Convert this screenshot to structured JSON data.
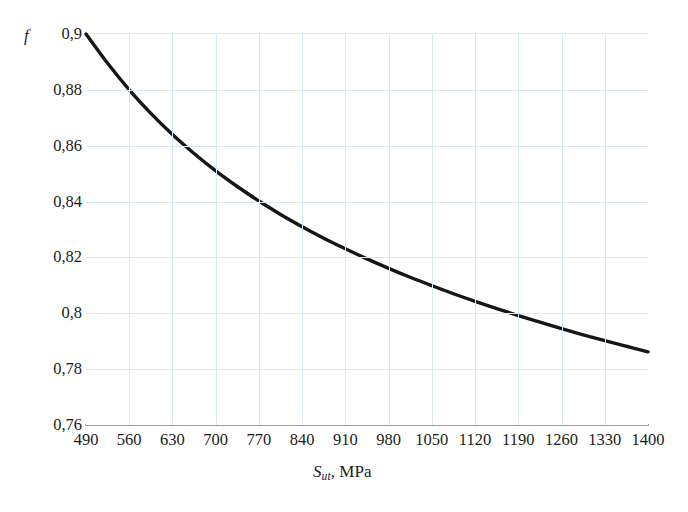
{
  "chart_data": {
    "type": "line",
    "title": "",
    "subtitle": "",
    "xlabel_symbol": "S",
    "xlabel_subscript": "ut",
    "xlabel_separator": ", ",
    "xlabel_unit": "MPa",
    "xlabel": "S_ut, MPa",
    "ylabel": "f",
    "xlim": [
      490,
      1400
    ],
    "ylim": [
      0.76,
      0.9
    ],
    "xticks": [
      490,
      560,
      630,
      700,
      770,
      840,
      910,
      980,
      1050,
      1120,
      1190,
      1260,
      1330,
      1400
    ],
    "xticklabels": [
      "490",
      "560",
      "630",
      "700",
      "770",
      "840",
      "910",
      "980",
      "1050",
      "1120",
      "1190",
      "1260",
      "1330",
      "1400"
    ],
    "yticks": [
      0.76,
      0.78,
      0.8,
      0.82,
      0.84,
      0.86,
      0.88,
      0.9
    ],
    "yticklabels": [
      "0,76",
      "0,78",
      "0,8",
      "0,82",
      "0,84",
      "0,86",
      "0,88",
      "0,9"
    ],
    "grid": true,
    "grid_color": "#d7eaf5",
    "axis_color": "#7aa8cd",
    "legend": null,
    "series": [
      {
        "name": "f",
        "color": "#161616",
        "linewidth": 3.4,
        "x": [
          490,
          525,
          560,
          595,
          630,
          665,
          700,
          735,
          770,
          805,
          840,
          875,
          910,
          945,
          980,
          1015,
          1050,
          1085,
          1120,
          1155,
          1190,
          1225,
          1260,
          1295,
          1330,
          1365,
          1400
        ],
        "y": [
          0.9,
          0.8895,
          0.88,
          0.8716,
          0.864,
          0.8572,
          0.851,
          0.8454,
          0.8402,
          0.8354,
          0.831,
          0.8269,
          0.8231,
          0.8195,
          0.8161,
          0.8129,
          0.8099,
          0.807,
          0.8043,
          0.8017,
          0.7992,
          0.7968,
          0.7945,
          0.7923,
          0.7902,
          0.7882,
          0.7862
        ]
      }
    ]
  },
  "axes": {
    "y_axis_title": "f",
    "x_axis_title_symbol": "S",
    "x_axis_title_sub": "ut",
    "x_axis_title_rest": ", MPa"
  }
}
